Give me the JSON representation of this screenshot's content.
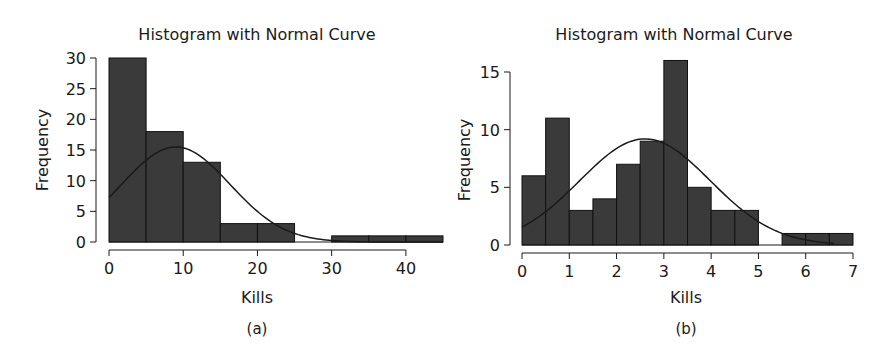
{
  "colors": {
    "bar_fill": "#3a3a3a",
    "bar_stroke": "#111111",
    "curve": "#1a1a1a",
    "axis": "#1a1a1a",
    "background": "#ffffff"
  },
  "panels": [
    {
      "caption": "(a)",
      "title": "Histogram with Normal Curve",
      "xlabel": "Kills",
      "ylabel": "Frequency"
    },
    {
      "caption": "(b)",
      "title": "Histogram with Normal Curve",
      "xlabel": "Kills",
      "ylabel": "Frequency"
    }
  ],
  "chart_data": [
    {
      "type": "bar",
      "title": "Histogram with Normal Curve",
      "xlabel": "Kills",
      "ylabel": "Frequency",
      "caption": "(a)",
      "bin_edges": [
        0,
        5,
        10,
        15,
        20,
        25,
        30,
        35,
        40,
        45
      ],
      "values": [
        30,
        18,
        13,
        3,
        3,
        0,
        1,
        1,
        1
      ],
      "xlim": [
        0,
        45
      ],
      "ylim": [
        0,
        30
      ],
      "xticks": [
        0,
        10,
        20,
        30,
        40
      ],
      "yticks": [
        0,
        5,
        10,
        15,
        20,
        25,
        30
      ],
      "grid": false,
      "legend": null,
      "overlay": {
        "type": "normal_curve",
        "mean": 9.0,
        "peak": 15.5,
        "sd": 7.3,
        "x_range": [
          0,
          45
        ]
      }
    },
    {
      "type": "bar",
      "title": "Histogram with Normal Curve",
      "xlabel": "Kills",
      "ylabel": "Frequency",
      "caption": "(b)",
      "bin_edges": [
        0,
        0.5,
        1,
        1.5,
        2,
        2.5,
        3,
        3.5,
        4,
        4.5,
        5,
        5.5,
        6,
        6.5,
        7
      ],
      "values": [
        6,
        11,
        3,
        4,
        7,
        9,
        16,
        5,
        3,
        3,
        0,
        1,
        1,
        1
      ],
      "xlim": [
        0,
        7
      ],
      "ylim": [
        0,
        15
      ],
      "xticks": [
        0,
        1,
        2,
        3,
        4,
        5,
        6,
        7
      ],
      "yticks": [
        0,
        5,
        10,
        15
      ],
      "grid": false,
      "legend": null,
      "overlay": {
        "type": "normal_curve",
        "mean": 2.6,
        "peak": 9.2,
        "sd": 1.38,
        "x_range": [
          0,
          6.6
        ]
      }
    }
  ]
}
